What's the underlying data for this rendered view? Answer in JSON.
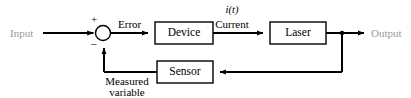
{
  "diagram": {
    "type": "control-system-block-diagram",
    "background_color": "#ffffff",
    "line_color": "#000000",
    "endpoint_label_color": "#9a9a9a",
    "blocks": [
      {
        "id": "device",
        "label": "Device",
        "x": 155,
        "y": 22,
        "w": 58,
        "h": 22
      },
      {
        "id": "laser",
        "label": "Laser",
        "x": 270,
        "y": 22,
        "w": 56,
        "h": 22
      },
      {
        "id": "sensor",
        "label": "Sensor",
        "x": 157,
        "y": 61,
        "w": 56,
        "h": 22
      }
    ],
    "summing_junction": {
      "id": "summing-junction",
      "cx": 103,
      "cy": 33,
      "r": 7.5,
      "plus_sign": "+",
      "minus_sign": "–"
    },
    "branch_point": {
      "cx": 342,
      "cy": 33,
      "r": 2.2
    },
    "signals": {
      "input": "Input",
      "error": "Error",
      "current_symbol": "i(t)",
      "current": "Current",
      "output": "Output",
      "measured_line1": "Measured",
      "measured_line2": "variable"
    }
  }
}
